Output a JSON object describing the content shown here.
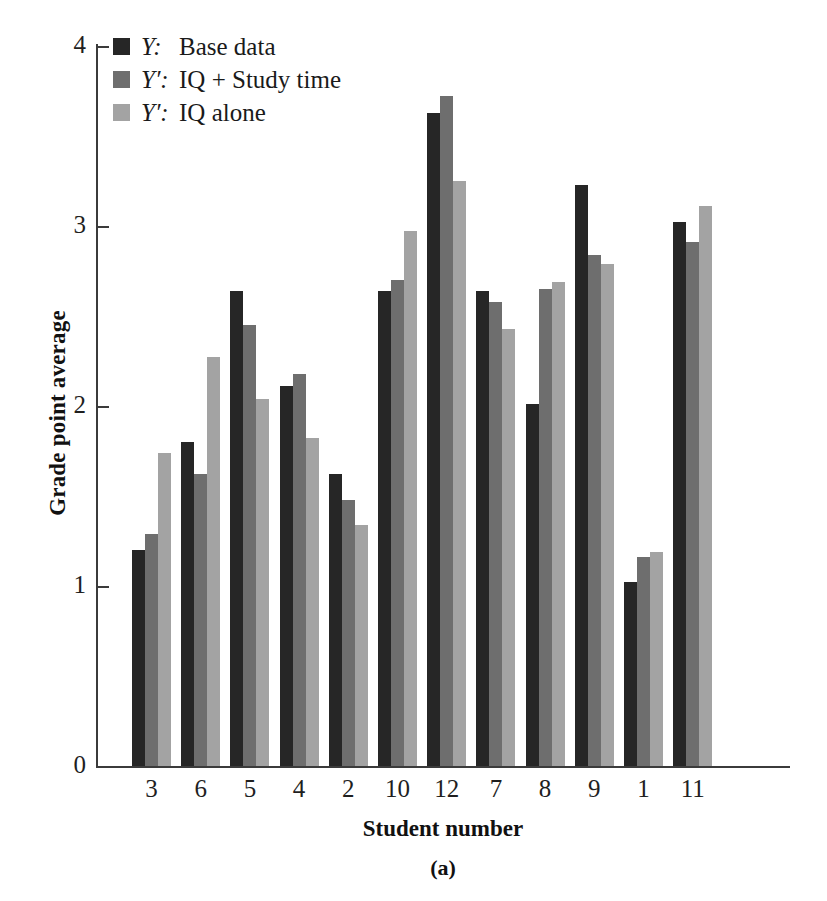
{
  "chart_data": {
    "type": "bar",
    "title": "",
    "caption": "(a)",
    "xlabel": "Student number",
    "ylabel": "Grade point average",
    "categories": [
      "3",
      "6",
      "5",
      "4",
      "2",
      "10",
      "12",
      "7",
      "8",
      "9",
      "1",
      "11"
    ],
    "ylim": [
      0,
      4
    ],
    "yticks": [
      "0",
      "1",
      "2",
      "3",
      "4"
    ],
    "ytick_values": [
      0,
      1,
      2,
      3,
      4
    ],
    "grid": false,
    "legend_position": "top-left",
    "series": [
      {
        "name": "Y:  Base data",
        "key": "Y",
        "label": "Base data",
        "color": "#262626",
        "values": [
          1.2,
          1.8,
          2.64,
          2.11,
          1.62,
          2.64,
          3.63,
          2.64,
          2.01,
          3.23,
          1.02,
          3.02
        ]
      },
      {
        "name": "Y':  IQ + Study time",
        "key": "Y'",
        "label": "IQ + Study time",
        "color": "#6e6e6e",
        "values": [
          1.29,
          1.62,
          2.45,
          2.18,
          1.48,
          2.7,
          3.72,
          2.58,
          2.65,
          2.84,
          1.16,
          2.91
        ]
      },
      {
        "name": "Y':  IQ alone",
        "key": "Y'",
        "label": "IQ alone",
        "color": "#a3a3a3",
        "values": [
          1.74,
          2.27,
          2.04,
          1.82,
          1.34,
          2.97,
          3.25,
          2.43,
          2.69,
          2.79,
          1.19,
          3.11
        ]
      }
    ]
  },
  "legend": {
    "rows": [
      {
        "key": "Y:",
        "text": "Base data",
        "color": "#262626"
      },
      {
        "key": "Y′:",
        "text": "IQ + Study time",
        "color": "#6e6e6e"
      },
      {
        "key": "Y′:",
        "text": "IQ alone",
        "color": "#a3a3a3"
      }
    ]
  }
}
